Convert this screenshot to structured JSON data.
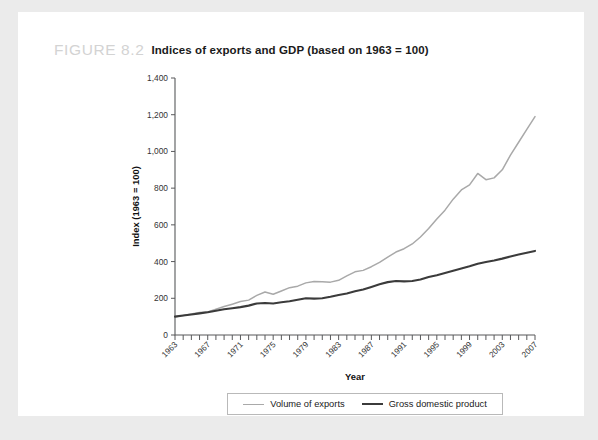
{
  "figure": {
    "label": "FIGURE 8.2",
    "title": "Indices of exports and GDP (based on 1963 = 100)"
  },
  "legend": {
    "exports_label": "Volume of exports",
    "gdp_label": "Gross domestic product"
  },
  "colors": {
    "exports": "#a9a9a9",
    "gdp": "#3b3b3b",
    "axis": "#58595b",
    "page_background": "#ebebeb",
    "card_background": "#ffffff",
    "figure_label": "#d3d3d3"
  },
  "chart_data": {
    "type": "line",
    "title": "Indices of exports and GDP (based on 1963 = 100)",
    "xlabel": "Year",
    "ylabel": "Index (1963 = 100)",
    "xlim": [
      1963,
      2007
    ],
    "ylim": [
      0,
      1400
    ],
    "ytick_values": [
      0,
      200,
      400,
      600,
      800,
      1000,
      1200,
      1400
    ],
    "ytick_labels": [
      "0",
      "200",
      "400",
      "600",
      "800",
      "1,000",
      "1,200",
      "1,400"
    ],
    "xtick_labels": [
      "1963",
      "1967",
      "1971",
      "1975",
      "1979",
      "1983",
      "1987",
      "1991",
      "1995",
      "1999",
      "2003",
      "2007"
    ],
    "xtick_label_step": 4,
    "xtick_minor_step": 1,
    "grid": false,
    "legend_position": "bottom",
    "x": [
      1963,
      1964,
      1965,
      1966,
      1967,
      1968,
      1969,
      1970,
      1971,
      1972,
      1973,
      1974,
      1975,
      1976,
      1977,
      1978,
      1979,
      1980,
      1981,
      1982,
      1983,
      1984,
      1985,
      1986,
      1987,
      1988,
      1989,
      1990,
      1991,
      1992,
      1993,
      1994,
      1995,
      1996,
      1997,
      1998,
      1999,
      2000,
      2001,
      2002,
      2003,
      2004,
      2005,
      2006,
      2007
    ],
    "series": [
      {
        "name": "Volume of exports",
        "values": [
          100,
          106,
          114,
          122,
          126,
          140,
          155,
          168,
          182,
          190,
          216,
          234,
          222,
          240,
          258,
          266,
          284,
          292,
          290,
          288,
          298,
          322,
          344,
          352,
          372,
          396,
          424,
          452,
          470,
          496,
          534,
          580,
          632,
          680,
          740,
          790,
          818,
          880,
          846,
          856,
          900,
          980,
          1050,
          1120,
          1190
        ]
      },
      {
        "name": "Gross domestic product",
        "values": [
          100,
          106,
          112,
          118,
          124,
          132,
          140,
          146,
          152,
          160,
          172,
          174,
          172,
          178,
          184,
          192,
          200,
          198,
          200,
          208,
          218,
          226,
          238,
          248,
          262,
          276,
          288,
          294,
          292,
          294,
          302,
          316,
          326,
          338,
          350,
          362,
          374,
          388,
          398,
          406,
          416,
          428,
          438,
          448,
          458
        ]
      }
    ]
  }
}
